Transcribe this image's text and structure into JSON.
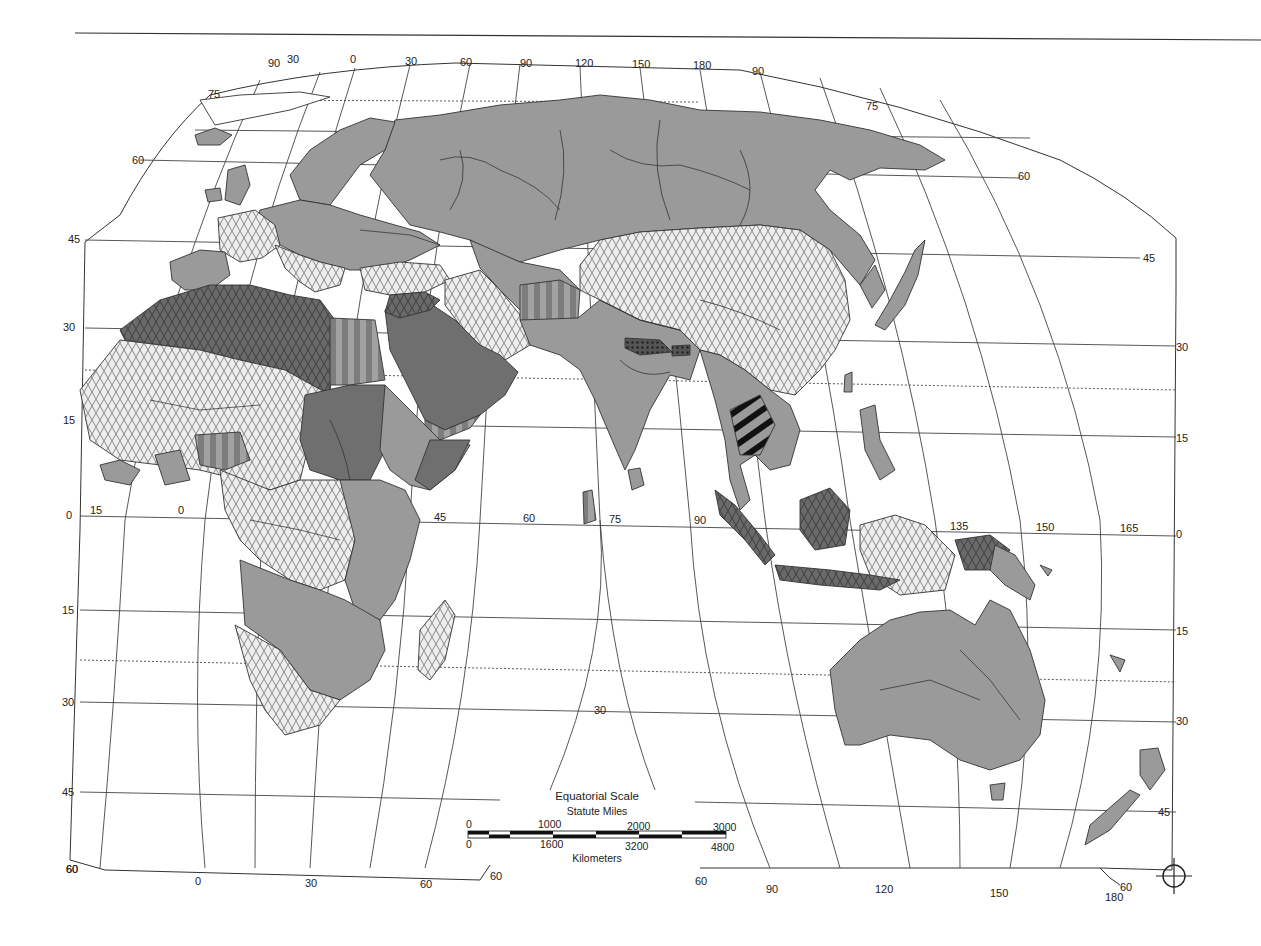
{
  "map": {
    "type": "thematic world map (Eastern Hemisphere, interrupted projection)",
    "fill_patterns": {
      "solid_gray": {
        "color": "#9a9a9a",
        "description": "plain medium-gray fill"
      },
      "light_lattice": {
        "color": "#e6e6e6",
        "description": "light diamond/lattice hatch"
      },
      "dark_lattice": {
        "color": "#6f6f6f",
        "description": "dark diamond/lattice hatch"
      },
      "vertical_stripes": {
        "color": "#8f8f8f",
        "description": "alternating gray vertical stripes"
      },
      "dark_solid": {
        "color": "#7a7a7a",
        "description": "darker solid gray"
      },
      "black_bars": {
        "color": "#111111",
        "description": "heavy black diagonal bars"
      }
    },
    "top_labels": [
      "90",
      "30",
      "0",
      "30",
      "60",
      "90",
      "120",
      "150",
      "180",
      "90"
    ],
    "left_latitude_labels": [
      "75",
      "60",
      "45",
      "30",
      "15",
      "0",
      "15",
      "30",
      "45",
      "60"
    ],
    "right_latitude_labels": [
      "75",
      "60",
      "45",
      "30",
      "15",
      "0",
      "15",
      "30",
      "45"
    ],
    "equator_longitude_labels": [
      "15",
      "0",
      "45",
      "60",
      "75",
      "90",
      "135",
      "150",
      "165"
    ],
    "bottom_labels_left": [
      "60",
      "0",
      "30",
      "60",
      "60"
    ],
    "bottom_labels_right": [
      "60",
      "90",
      "120",
      "150",
      "180",
      "60"
    ],
    "inner_label": "30"
  },
  "scale": {
    "title": "Equatorial Scale",
    "miles_label": "Statute Miles",
    "miles_ticks": [
      "0",
      "1000",
      "2000",
      "3000"
    ],
    "km_ticks": [
      "0",
      "1600",
      "3200",
      "4800"
    ],
    "km_label": "Kilometers"
  },
  "registration_mark": "crosshair-circle"
}
